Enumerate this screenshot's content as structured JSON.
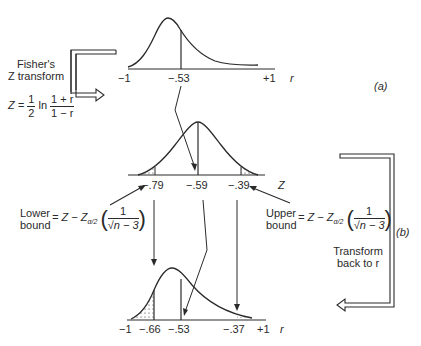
{
  "panel_a": {
    "label": "(a)",
    "top_curve": {
      "axis_variable": "r",
      "ticks": [
        "−1",
        "−.53",
        "+1"
      ]
    },
    "fisher_label_line1": "Fisher's",
    "fisher_label_line2": "Z transform",
    "formula_lhs": "Z =",
    "formula_half_num": "1",
    "formula_half_den": "2",
    "formula_ln": "ln",
    "formula_frac_num": "1 + r",
    "formula_frac_den": "1 − r"
  },
  "middle_curve": {
    "axis_variable": "Z",
    "ticks": [
      "−.79",
      "−.59",
      "−.39"
    ]
  },
  "lower_bound": {
    "line1": "Lower",
    "line2": "bound",
    "formula_prefix": "= Z − Z",
    "subscript": "α/2",
    "num": "1",
    "den": "√n − 3"
  },
  "upper_bound": {
    "line1": "Upper",
    "line2": "bound",
    "formula_prefix": "= Z − Z",
    "subscript": "α/2",
    "num": "1",
    "den": "√n − 3"
  },
  "panel_b": {
    "label": "(b)",
    "transform_line1": "Transform",
    "transform_line2": "back to r"
  },
  "bottom_curve": {
    "axis_variable": "r",
    "ticks": [
      "−1",
      "−.66",
      "−.53",
      "−.37",
      "+1"
    ]
  },
  "colors": {
    "ink": "#2a2a2a",
    "background": "#ffffff"
  }
}
